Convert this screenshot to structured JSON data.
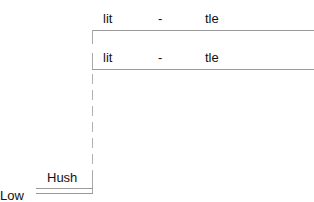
{
  "rows": [
    {
      "col1": "lit",
      "col2": "-",
      "col3": "tle"
    },
    {
      "col1": "lit",
      "col2": "-",
      "col3": "tle"
    }
  ],
  "footer": {
    "label_upper": "Hush",
    "label_lower": "Low"
  },
  "colors": {
    "line": "#9a9a9a",
    "text": "#111111",
    "background": "#ffffff"
  }
}
